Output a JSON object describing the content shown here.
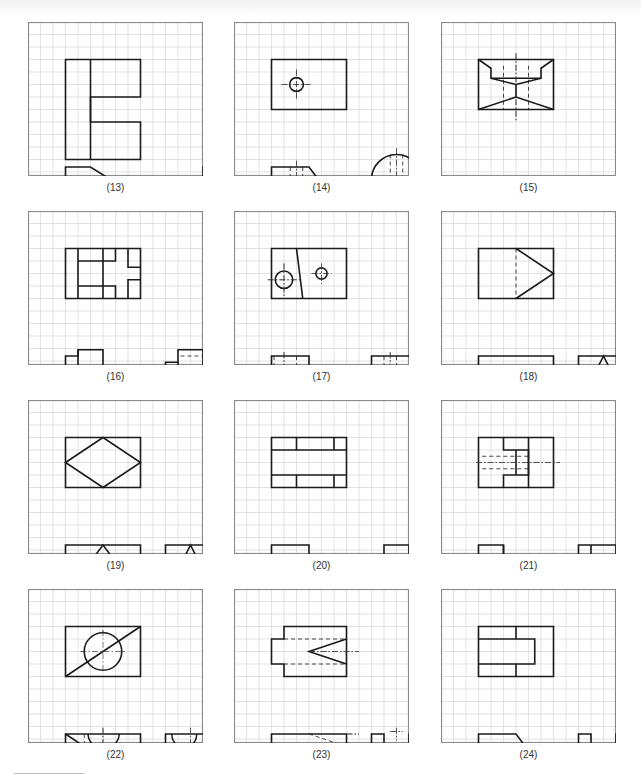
{
  "figure": {
    "grid": {
      "cols": 14,
      "rows": 12,
      "cell": 12.5,
      "line_color": "#d6d6d6",
      "border_color": "#8a8a8a",
      "ink": "#1a1a1a"
    },
    "panels": [
      {
        "label": "(13)",
        "x": 28,
        "y": 22,
        "solid": [
          "M3,3 H9 V6 H5 V8 H9 V11 H3 Z",
          "M5,3 V11",
          "M3,19 H5 L9,21.5 V24.5 L5,22 V26 L3,25 Z",
          "M14,19 H18 V26 H14 Z",
          "M15,20 H16 V26 H15 Z"
        ],
        "hidden": [
          "M14,23 H18"
        ],
        "center": []
      },
      {
        "label": "(14)",
        "x": 234,
        "y": 22,
        "solid": [
          "M3,3 H9 V7 H3 Z",
          "M3,19 H6 L9,23 H3 Z",
          "M11,23 V20 A2,2 0 0 1 15,20 V23 Z"
        ],
        "circles": [
          {
            "cx": 5,
            "cy": 5,
            "r": 0.55
          }
        ],
        "hidden": [
          "M4.5,19 V23",
          "M5.5,19 V23",
          "M12.5,18 V23",
          "M13.5,18 V23"
        ],
        "center": [
          "M3.8,5 H6.2",
          "M5,3.8 V6.2",
          "M2.5,21 H8",
          "M5,18.5 V23.5",
          "M10.5,21 H15.5",
          "M13,17.5 V23.5"
        ]
      },
      {
        "label": "(15)",
        "x": 441,
        "y": 22,
        "solid": [
          "M3,3 H9 V7 H3 Z",
          "M3,3 L4,3.7 V4.5 H8 V3.7 L9,3",
          "M4,4.5 L6,5 L8,4.5",
          "M6,5 V6",
          "M3,7 L6,6 L9,7",
          "M3,22 L6,20 L9,22 Z",
          "M3,22 H9 V24 H7 A1,1 0 0 0 5,24 H3 Z",
          "M11,22 L12,20 H13 L14,21 H15 L15.5,22 V24 H11 Z"
        ],
        "hidden": [
          "M5,3.5 V7",
          "M7,3.5 V7",
          "M11,23 H15.5"
        ],
        "center": [
          "M6,2.5 V8",
          "M4.5,24 H7.5",
          "M6,22.5 V24.5",
          "M10.5,24 H16"
        ]
      },
      {
        "label": "(16)",
        "x": 28,
        "y": 211,
        "solid": [
          "M3,3 H9 V7 H3 Z",
          "M4,3 V7",
          "M4,4 H7 V3",
          "M6,3 V7",
          "M4,6 H7 V7",
          "M8,3 V4.5 H9",
          "M8,7 V5.5 H9",
          "M3,19 H4 V18.5 H6 V22 H7 V21 H9 V23 H3 Z",
          "M4,18.5 V20 H6",
          "M8,21 L9,23",
          "M11,19.5 H12 V18.5 H14 V19.5 H15 V23 H11 Z",
          "M11,21 H15",
          "M12,19.5 V20.5 H11",
          "M14,19.5 V20.5 H15",
          "M12.5,21 V23",
          "M13.5,21 V23"
        ],
        "hidden": [
          "M12.2,19 H14",
          "M11.2,22.3 H12",
          "M14,22.3 H14.8",
          "M12,21 V22.3",
          "M14,21 V22.3"
        ],
        "center": []
      },
      {
        "label": "(17)",
        "x": 234,
        "y": 211,
        "solid": [
          "M3,3 H9 V7 H3 Z",
          "M5,3 L5.5,7",
          "M3,19 H6 V22 H9 V23 H3 Z",
          "M11,19 H15 V23 H11 Z",
          "M11,22 H15"
        ],
        "circles": [
          {
            "cx": 4,
            "cy": 5.5,
            "r": 0.7
          },
          {
            "cx": 7,
            "cy": 5,
            "r": 0.45
          }
        ],
        "hidden": [
          "M3.2,19 V23",
          "M5,19 V23",
          "M7,22 V23",
          "M8,22 V23",
          "M12,19 V23",
          "M13,19 V23"
        ],
        "center": [
          "M2.7,5.5 H5.3",
          "M4,4.2 V6.8",
          "M6.2,5 H7.8",
          "M7,4.2 V5.8",
          "M4,18.7 V23.3",
          "M7.5,21.7 V23.3",
          "M12.5,18.7 V23.3"
        ]
      },
      {
        "label": "(18)",
        "x": 441,
        "y": 211,
        "solid": [
          "M3,3 H9 V7 H3 Z",
          "M6,3 L9,5 L6,7",
          "M3,19 H9 V23 H3 V21 H6 V20 H3 Z",
          "M11,19 H15 V23 H11 Z",
          "M11,23 L13,19 L15,23"
        ],
        "hidden": [
          "M6,3 V7",
          "M11,21 H15",
          "M11,22 H15"
        ],
        "center": []
      },
      {
        "label": "(19)",
        "x": 28,
        "y": 400,
        "solid": [
          "M3,3 H9 V7 H3 Z",
          "M3,5 L6,3 L9,5 L6,7 Z",
          "M3,19 H9 V23 H3 V22 H6 V21 H3 Z",
          "M3,23 L6,19 L9,23",
          "M11,19 H15 V23 H11 Z",
          "M11,23 L13,19 L15,23"
        ],
        "hidden": [
          "M11,21 H15",
          "M11,22 H15"
        ],
        "center": []
      },
      {
        "label": "(20)",
        "x": 234,
        "y": 400,
        "solid": [
          "M3,3 H9 V7 H3 Z",
          "M3,4 H9",
          "M3,6 H9",
          "M5,3 V4",
          "M8,3 V4",
          "M5,6 V7",
          "M8,6 V7",
          "M3,19 H6 V21 H9 V23 H3 Z",
          "M3,20 H5 V22 H8 L9,23",
          "M11,20 H12 V19 H14 V20 H15 V23 H11 Z",
          "M12,20 V23",
          "M14,20 V23",
          "M12,21 H14",
          "M11,22 H12",
          "M14,22 H15"
        ],
        "hidden": [],
        "center": []
      },
      {
        "label": "(21)",
        "x": 441,
        "y": 400,
        "solid": [
          "M3,3 H9 V7 H3 Z",
          "M5,3 V4 H7 V6 H5 V7",
          "M7,3 V7",
          "M6,4 V6",
          "M3,19 H5 V20 H7 V22 H9 V23 H3 Z",
          "M5,19 V21 H7",
          "M11,19 H15 V23 H11 Z",
          "M12,19 V21 H11",
          "M14,19 V21 H15",
          "M12,20 H14",
          "M11,22 H15"
        ],
        "circles": [
          {
            "cx": 13,
            "cy": 22,
            "r": 0.45
          }
        ],
        "hidden": [
          "M3.3,4.5 H7",
          "M3.3,5.5 H7",
          "M3.3,21.5 H7",
          "M3.3,22.5 H9"
        ],
        "center": [
          "M2.8,5 H9.5",
          "M2.8,22 H9.5",
          "M12.3,22 H13.7",
          "M13,21.3 V22.7"
        ]
      },
      {
        "label": "(22)",
        "x": 28,
        "y": 589,
        "solid": [
          "M3,3 H9 V7 H3 Z",
          "M3,7 L9,3",
          "M3,19 H9 V23 H3 Z",
          "M3,19 L9,23",
          "M4.8,19 A1.25,1.2 0 0 0 7.3,19",
          "M11,19 H15 V23 H11 Z",
          "M11,23 L15,19",
          "M11.5,19 A1,1.1 0 0 0 13.5,19"
        ],
        "circles": [
          {
            "cx": 6,
            "cy": 5,
            "r": 1.5,
            "fill": "#ffffff"
          }
        ],
        "hidden": [
          "M4.5,19 V23"
        ],
        "center": [
          "M4.2,5 H7.8",
          "M6,3.3 V6.7",
          "M6,18.5 V23.5",
          "M13,18.5 V23.5"
        ]
      },
      {
        "label": "(23)",
        "x": 234,
        "y": 589,
        "solid": [
          "M4,3 H9 V7 H4 V6 H3 V4 H4 Z",
          "M9,4 L6,5 L9,6",
          "M3,19 H9 V23 H3 Z",
          "M4,22 H9",
          "M11,19 H12 V19.7 A1,1 0 0 0 14,19.7 V19 H15 V22 H14 V23 H12 V22 H11 Z"
        ],
        "hidden": [
          "M4,4 H9",
          "M4,6 H9",
          "M6,19 L9,20"
        ],
        "center": [
          "M6,5 H10",
          "M9,19 H10",
          "M12.5,18.8 H13.5",
          "M13,18.5 V19.5",
          "M12,20 V22",
          "M14,20 V22"
        ]
      },
      {
        "label": "(24)",
        "x": 441,
        "y": 589,
        "solid": [
          "M3,3 H9 V7 H3 Z",
          "M6,3 V4",
          "M6,6 V7",
          "M3,4 H7.5 V6 H3",
          "M3,19 H6 L9,23 H3 Z",
          "M11,19 H12 V21 H14 V19 H15 V23 H11 Z"
        ],
        "hidden": [],
        "center": []
      }
    ]
  }
}
